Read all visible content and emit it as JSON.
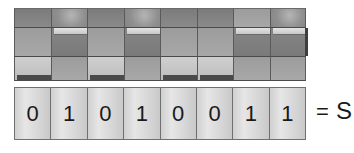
{
  "diagram": {
    "title": "",
    "switches": [
      {
        "index": 0,
        "state": "off",
        "bit": "0"
      },
      {
        "index": 1,
        "state": "on",
        "bit": "1"
      },
      {
        "index": 2,
        "state": "off",
        "bit": "0"
      },
      {
        "index": 3,
        "state": "on",
        "bit": "1"
      },
      {
        "index": 4,
        "state": "off",
        "bit": "0"
      },
      {
        "index": 5,
        "state": "off",
        "bit": "0"
      },
      {
        "index": 6,
        "state": "on",
        "bit": "1"
      },
      {
        "index": 7,
        "state": "on",
        "bit": "1"
      }
    ],
    "bits": [
      "0",
      "1",
      "0",
      "1",
      "0",
      "0",
      "1",
      "1"
    ],
    "equals_sign": "=",
    "character": "S",
    "colors": {
      "switch_dark": "#7b7b7b",
      "switch_light": "#cfcfcf",
      "digit_box": "#dcdcdc",
      "text": "#1a1a1a"
    }
  }
}
